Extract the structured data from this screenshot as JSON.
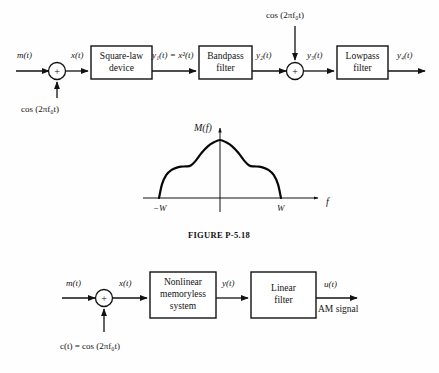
{
  "figure": {
    "caption": "FIGURE P-5.18"
  },
  "diagram_top": {
    "name": "square-law-am-modulator-block-diagram",
    "inputs": {
      "message_signal": "m(t)",
      "carrier_signal": "cos (2πf₀t)",
      "carrier_signal_2": "cos (2πf₀t)"
    },
    "signals": {
      "adder_output": "x(t)",
      "square_law_output": "y₁(t) = x²(t)",
      "bandpass_output": "y₂(t)",
      "second_adder_output": "y₃(t)",
      "lowpass_output": "y₄(t)"
    },
    "blocks": [
      {
        "id": "square-law-device",
        "line1": "Square-law",
        "line2": "device"
      },
      {
        "id": "bandpass-filter",
        "line1": "Bandpass",
        "line2": "filter"
      },
      {
        "id": "lowpass-filter",
        "line1": "Lowpass",
        "line2": "filter"
      }
    ],
    "adders": [
      {
        "id": "adder-1",
        "symbol": "+"
      },
      {
        "id": "adder-2",
        "symbol": "+"
      }
    ]
  },
  "chart_data": {
    "type": "line",
    "name": "message-spectrum-plot",
    "title": "M(f)",
    "xlabel": "f",
    "ylabel": "M(f)",
    "xticks": [
      "−W",
      "W"
    ],
    "xtick_values": [
      -1,
      1
    ],
    "xlim": [
      -1.55,
      1.75
    ],
    "ylim": [
      0,
      1.12
    ],
    "grid": false,
    "legend": false,
    "x": [
      -1.0,
      -0.95,
      -0.88,
      -0.8,
      -0.72,
      -0.64,
      -0.56,
      -0.48,
      -0.4,
      -0.3,
      -0.2,
      -0.1,
      0.0,
      0.1,
      0.2,
      0.3,
      0.4,
      0.48,
      0.56,
      0.64,
      0.72,
      0.8,
      0.88,
      0.95,
      1.0
    ],
    "y": [
      0.0,
      0.24,
      0.4,
      0.48,
      0.52,
      0.54,
      0.545,
      0.56,
      0.64,
      0.78,
      0.89,
      0.96,
      1.0,
      0.96,
      0.89,
      0.78,
      0.64,
      0.56,
      0.545,
      0.54,
      0.52,
      0.48,
      0.4,
      0.24,
      0.0
    ]
  },
  "diagram_bottom": {
    "name": "nonlinear-am-modulator-block-diagram",
    "inputs": {
      "message_signal": "m(t)",
      "carrier_signal": "c(t) = cos (2πf₀t)"
    },
    "signals": {
      "adder_output": "x(t)",
      "nonlinear_output": "y(t)",
      "filter_output": "u(t)",
      "output_note": "AM signal"
    },
    "blocks": [
      {
        "id": "nonlinear-memoryless-system",
        "line1": "Nonlinear",
        "line2": "memoryless",
        "line3": "system"
      },
      {
        "id": "linear-filter",
        "line1": "Linear",
        "line2": "filter"
      }
    ],
    "adders": [
      {
        "id": "adder-1",
        "symbol": "+"
      }
    ]
  },
  "colors": {
    "ink": "#121212",
    "paper": "#fefefe"
  }
}
